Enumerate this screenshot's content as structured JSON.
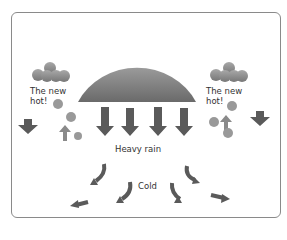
{
  "diagram": {
    "title": "",
    "labels": {
      "left_cloud": [
        "The new",
        "hot!"
      ],
      "right_cloud": [
        "The new",
        "hot!"
      ],
      "center": "Heavy rain",
      "bottom": "Cold"
    },
    "elements": {
      "big_cloud": "semicircle-cumulonimbus",
      "small_clouds": 2,
      "rain_arrows": 4,
      "side_down_arrows": 2,
      "updraft_arrows": 2,
      "outflow_arrows": 6
    },
    "colors": {
      "cloud_top": "#8a8a8a",
      "cloud_bottom": "#6a6a6a",
      "arrow": "#5a5a5a",
      "bubble": "#9a9a9a",
      "frame": "#8a8a8a"
    }
  }
}
